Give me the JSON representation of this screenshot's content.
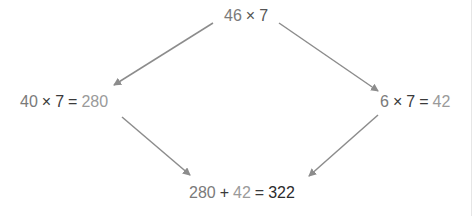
{
  "diagram": {
    "top": {
      "a": "46",
      "op": "×",
      "b": "7"
    },
    "left": {
      "a": "40",
      "op": "×",
      "b": "7",
      "eq": "=",
      "result": "280"
    },
    "right": {
      "a": "6",
      "op": "×",
      "b": "7",
      "eq": "=",
      "result": "42"
    },
    "bottom": {
      "a": "280",
      "op": "+",
      "b": "42",
      "eq": "=",
      "result": "322"
    },
    "arrows": [
      {
        "from": "top",
        "to": "left"
      },
      {
        "from": "top",
        "to": "right"
      },
      {
        "from": "left",
        "to": "bottom"
      },
      {
        "from": "right",
        "to": "bottom"
      }
    ],
    "colors": {
      "arrow": "#8c8c8c",
      "operand": "#7a7a7a",
      "partial": "#9a9a9a",
      "final": "#2b2b2b"
    }
  }
}
